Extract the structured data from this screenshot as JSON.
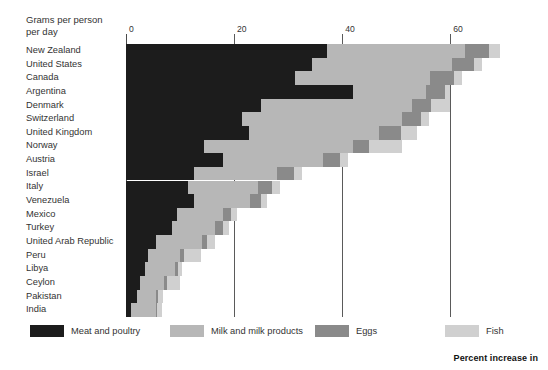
{
  "header": {
    "caption": "Grams per person\nper day"
  },
  "footnote": {
    "text": "Percent increase in"
  },
  "legend": {
    "position": "bottom",
    "items": [
      {
        "label": "Meat and poultry",
        "color": "#1c1c1c",
        "key": "meat"
      },
      {
        "label": "Milk and milk products",
        "color": "#b7b7b7",
        "key": "milk"
      },
      {
        "label": "Eggs",
        "color": "#8a8a8a",
        "key": "eggs"
      },
      {
        "label": "Fish",
        "color": "#d0d0d0",
        "key": "fish"
      }
    ]
  },
  "chart_data": {
    "type": "bar",
    "orientation": "horizontal",
    "stacked": true,
    "title": "",
    "subtitle": "",
    "xlabel": "Grams per person per day",
    "ylabel": "",
    "xlim": [
      0,
      74
    ],
    "xticks": [
      0,
      20,
      40,
      60
    ],
    "xticklabels": [
      "0",
      "20",
      "40",
      "60"
    ],
    "grid": "vertical",
    "categories": [
      "New Zealand",
      "United States",
      "Canada",
      "Argentina",
      "Denmark",
      "Switzerland",
      "United Kingdom",
      "Norway",
      "Austria",
      "Israel",
      "Italy",
      "Venezuela",
      "Mexico",
      "Turkey",
      "United Arab Republic",
      "Peru",
      "Libya",
      "Ceylon",
      "Pakistan",
      "India"
    ],
    "series": [
      {
        "name": "Meat and poultry",
        "color": "#1c1c1c",
        "values": [
          37.2,
          34.4,
          31.2,
          42.0,
          25.0,
          21.5,
          22.8,
          14.5,
          18.0,
          12.5,
          11.5,
          12.5,
          9.5,
          8.5,
          5.5,
          4.0,
          3.5,
          2.5,
          2.0,
          1.0
        ]
      },
      {
        "name": "Milk and milk products",
        "color": "#b7b7b7",
        "values": [
          25.5,
          26.0,
          25.0,
          13.5,
          28.0,
          29.5,
          24.0,
          27.5,
          18.5,
          15.5,
          13.0,
          10.5,
          8.5,
          8.0,
          8.5,
          6.0,
          5.5,
          4.5,
          3.5,
          4.5
        ]
      },
      {
        "name": "Eggs",
        "color": "#8a8a8a",
        "values": [
          4.5,
          4.0,
          4.5,
          3.5,
          3.5,
          3.5,
          4.0,
          3.0,
          3.0,
          3.0,
          2.5,
          2.0,
          1.5,
          1.5,
          1.0,
          0.8,
          0.6,
          0.5,
          0.4,
          0.3
        ]
      },
      {
        "name": "Fish",
        "color": "#d0d0d0",
        "values": [
          2.0,
          1.5,
          1.5,
          1.0,
          3.5,
          1.5,
          3.0,
          6.0,
          1.5,
          1.5,
          1.5,
          1.0,
          1.0,
          1.0,
          1.5,
          3.0,
          0.8,
          2.5,
          1.0,
          0.8
        ]
      }
    ]
  }
}
